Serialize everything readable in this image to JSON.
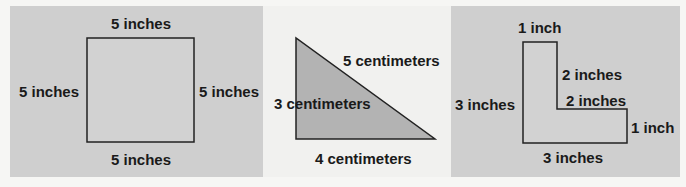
{
  "figures": [
    {
      "shape": "square",
      "background": "#cfcfcf",
      "labels": {
        "top": "5 inches",
        "left": "5 inches",
        "right": "5 inches",
        "bottom": "5 inches"
      }
    },
    {
      "shape": "right-triangle",
      "background": "#f1f1ef",
      "fill": "#b3b3b3",
      "labels": {
        "hypotenuse": "5 centimeters",
        "height": "3 centimeters",
        "base": "4 centimeters"
      }
    },
    {
      "shape": "l-shape",
      "background": "#cfcfcf",
      "labels": {
        "top": "1 inch",
        "inner_vertical": "2 inches",
        "inner_horizontal": "2 inches",
        "right": "1 inch",
        "left": "3 inches",
        "bottom": "3 inches"
      }
    }
  ]
}
